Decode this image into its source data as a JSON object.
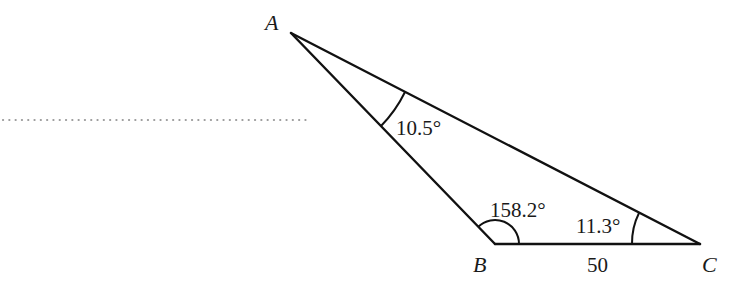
{
  "diagram": {
    "type": "triangle",
    "vertices": [
      {
        "id": "A",
        "label": "A",
        "x": 291,
        "y": 33,
        "label_x": 265,
        "label_y": 30
      },
      {
        "id": "B",
        "label": "B",
        "x": 495,
        "y": 244,
        "label_x": 473,
        "label_y": 272
      },
      {
        "id": "C",
        "label": "C",
        "x": 700,
        "y": 244,
        "label_x": 702,
        "label_y": 272
      }
    ],
    "angles": [
      {
        "vertex": "A",
        "label": "10.5°",
        "label_x": 396,
        "label_y": 135
      },
      {
        "vertex": "B",
        "label": "158.2°",
        "label_x": 490,
        "label_y": 217
      },
      {
        "vertex": "C",
        "label": "11.3°",
        "label_x": 576,
        "label_y": 233
      }
    ],
    "sides": [
      {
        "between": [
          "B",
          "C"
        ],
        "label": "50",
        "label_x": 587,
        "label_y": 272
      }
    ],
    "guide_line": {
      "style": "dotted",
      "color": "#9a9a9a",
      "x1": 0,
      "x2": 307,
      "y": 120
    }
  },
  "colors": {
    "stroke": "#111111",
    "text": "#1a1a1a",
    "dots": "#9a9a9a",
    "background": "#ffffff"
  }
}
